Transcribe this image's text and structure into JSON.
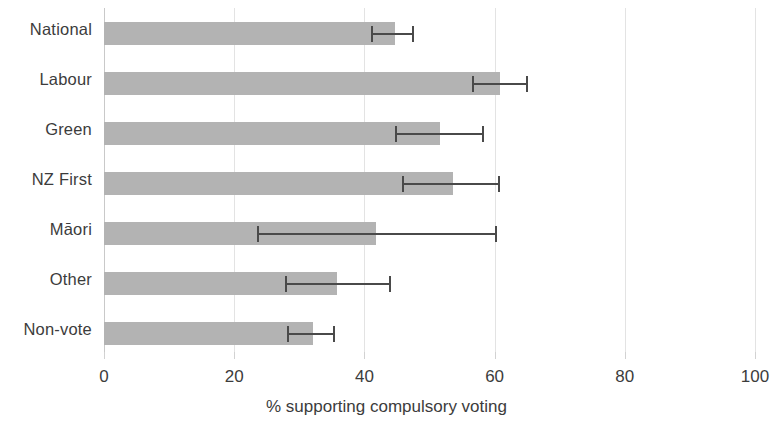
{
  "chart_data": {
    "type": "bar",
    "orientation": "horizontal",
    "title": "",
    "subtitle": "",
    "xlabel": "% supporting compulsory voting",
    "ylabel": "",
    "xlim": [
      0,
      100
    ],
    "xticks": [
      0,
      20,
      40,
      60,
      80,
      100
    ],
    "xtick_labels": [
      "0",
      "20",
      "40",
      "60",
      "80",
      "100"
    ],
    "grid": "vertical gridlines at 20, 40, 60, 80, 100",
    "legend": "none",
    "error_bars": "95% confidence intervals",
    "bar_color": "#b3b3b3",
    "error_color": "#4a4a4a",
    "grid_color": "#e3e3e3",
    "categories": [
      "National",
      "Labour",
      "Green",
      "NZ First",
      "Māori",
      "Other",
      "Non-vote"
    ],
    "values": [
      44.7,
      60.8,
      51.6,
      53.6,
      41.8,
      35.8,
      32.1
    ],
    "ci_low": [
      41.2,
      56.7,
      44.8,
      45.9,
      23.7,
      27.9,
      28.3
    ],
    "ci_high": [
      47.5,
      65.0,
      58.2,
      60.7,
      60.2,
      43.9,
      35.3
    ],
    "bars": [
      {
        "label": "National",
        "value": 44.7,
        "ci_low": 41.2,
        "ci_high": 47.5
      },
      {
        "label": "Labour",
        "value": 60.8,
        "ci_low": 56.7,
        "ci_high": 65.0
      },
      {
        "label": "Green",
        "value": 51.6,
        "ci_low": 44.8,
        "ci_high": 58.2
      },
      {
        "label": "NZ First",
        "value": 53.6,
        "ci_low": 45.9,
        "ci_high": 60.7
      },
      {
        "label": "Māori",
        "value": 41.8,
        "ci_low": 23.7,
        "ci_high": 60.2
      },
      {
        "label": "Other",
        "value": 35.8,
        "ci_low": 27.9,
        "ci_high": 43.9
      },
      {
        "label": "Non-vote",
        "value": 32.1,
        "ci_low": 28.3,
        "ci_high": 35.3
      }
    ]
  }
}
